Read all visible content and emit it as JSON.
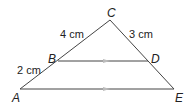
{
  "diagram": {
    "points": {
      "A": {
        "label": "A",
        "x": 20,
        "y": 89
      },
      "B": {
        "label": "B",
        "x": 58,
        "y": 61
      },
      "C": {
        "label": "C",
        "x": 110,
        "y": 20
      },
      "D": {
        "label": "D",
        "x": 148,
        "y": 61
      },
      "E": {
        "label": "E",
        "x": 174,
        "y": 89
      }
    },
    "measurements": {
      "CB": "4 cm",
      "CD": "3 cm",
      "BA": "2 cm"
    },
    "parallel_segments": [
      "BD",
      "AE"
    ],
    "colors": {
      "line": "#444444",
      "arrow": "#bbbbbb"
    }
  }
}
